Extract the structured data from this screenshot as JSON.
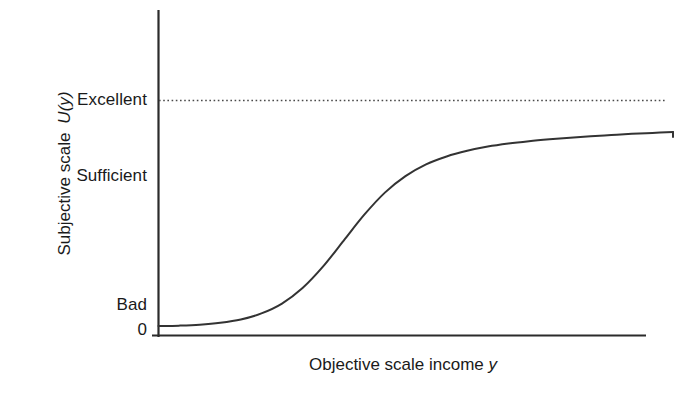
{
  "figure": {
    "background_color": "#ffffff",
    "line_color": "#333333",
    "text_color": "#1a1a1a"
  },
  "axes": {
    "y_title_text": "Subjective scale",
    "y_title_symbol": "U(y)",
    "x_title_text": "Objective scale income",
    "x_title_symbol": "y"
  },
  "labels": {
    "excellent": "Excellent",
    "sufficient": "Sufficient",
    "bad": "Bad",
    "zero": "0"
  },
  "chart_data": {
    "type": "line",
    "title": "",
    "subtitle": "",
    "xlabel": "Objective scale income y",
    "ylabel": "Subjective scale U(y)",
    "grid": false,
    "legend": null,
    "legend_position": "none",
    "xlim": [
      0,
      100
    ],
    "ylim": [
      0,
      100
    ],
    "x_tick_labels": [],
    "y_tick_labels": [
      "0",
      "Bad",
      "Sufficient",
      "Excellent"
    ],
    "y_tick_values": [
      0,
      6,
      45,
      90
    ],
    "annotations": [
      {
        "name": "excellent-asymptote",
        "type": "horizontal-dotted-line",
        "y_value": 90,
        "label": "Excellent",
        "style": "dotted"
      }
    ],
    "series": [
      {
        "name": "utility",
        "style": "solid",
        "color": "#333333",
        "x": [
          0,
          4,
          8,
          12,
          16,
          20,
          24,
          28,
          32,
          36,
          40,
          44,
          48,
          52,
          56,
          60,
          64,
          68,
          72,
          76,
          80,
          84,
          88,
          92,
          96,
          100
        ],
        "values": [
          4,
          4.2,
          4.6,
          5.4,
          6.8,
          9.4,
          13.6,
          20.2,
          29.4,
          40.4,
          51.4,
          60.8,
          67.8,
          72.8,
          76.2,
          78.6,
          80.4,
          81.7,
          82.7,
          83.5,
          84.2,
          84.8,
          85.3,
          85.8,
          86.2,
          86.6
        ]
      }
    ]
  }
}
